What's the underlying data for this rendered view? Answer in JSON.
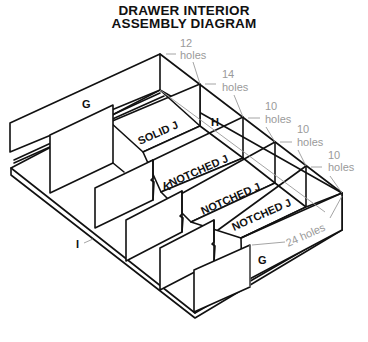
{
  "title": {
    "line1": "DRAWER INTERIOR",
    "line2": "ASSEMBLY DIAGRAM"
  },
  "parts": {
    "back_panel": "G",
    "front_panel": "G",
    "side_h": "H",
    "solid_j": "SOLID J",
    "notched_j_1": "NOTCHED J",
    "notched_j_2": "NOTCHED J",
    "notched_j_3": "NOTCHED J",
    "divider_k": "K",
    "floor_i": "I"
  },
  "hole_callouts": [
    {
      "count": "12",
      "unit": "holes"
    },
    {
      "count": "14",
      "unit": "holes"
    },
    {
      "count": "10",
      "unit": "holes"
    },
    {
      "count": "10",
      "unit": "holes"
    },
    {
      "count": "10",
      "unit": "holes"
    },
    {
      "text": "24 holes"
    }
  ],
  "colors": {
    "line": "#111111",
    "callout": "#9a9a9a",
    "background": "#ffffff"
  }
}
